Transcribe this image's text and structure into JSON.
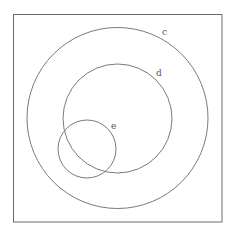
{
  "diagram": {
    "type": "venn-euler",
    "universe": {
      "label": ""
    },
    "sets": [
      {
        "id": "c",
        "label": "c",
        "contains": [
          "d",
          "e"
        ]
      },
      {
        "id": "d",
        "label": "d",
        "contained_in": "c",
        "overlaps": [
          "e"
        ]
      },
      {
        "id": "e",
        "label": "e",
        "contained_in": "c",
        "overlaps": [
          "d"
        ]
      }
    ],
    "colors": {
      "stroke": "#7a7a7a",
      "frame": "#6b6b6b",
      "label": "#555555",
      "background": "#ffffff"
    }
  }
}
